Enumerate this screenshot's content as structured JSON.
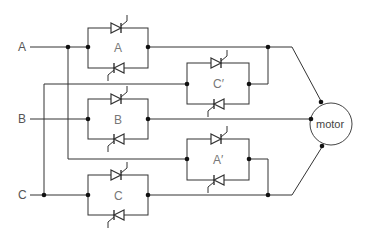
{
  "diagram": {
    "type": "thyristor reversing motor starter circuit",
    "inputs": [
      {
        "id": "A",
        "label": "A"
      },
      {
        "id": "B",
        "label": "B"
      },
      {
        "id": "C",
        "label": "C"
      }
    ],
    "blocks": [
      {
        "id": "A",
        "label": "A"
      },
      {
        "id": "C-prime",
        "label": "C′"
      },
      {
        "id": "B",
        "label": "B"
      },
      {
        "id": "A-prime",
        "label": "A′"
      },
      {
        "id": "C",
        "label": "C"
      }
    ],
    "load": {
      "label": "motor"
    },
    "colors": {
      "line": "#333333",
      "text": "#555555",
      "background": "#ffffff"
    }
  }
}
